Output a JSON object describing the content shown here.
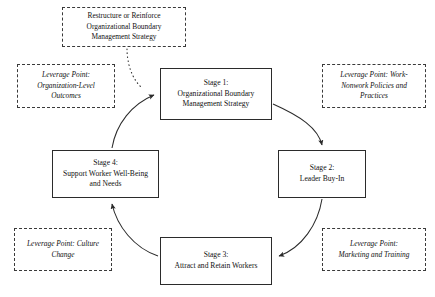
{
  "diagram": {
    "nodes": {
      "restructure": {
        "label": "Restructure or Reinforce\nOrganizational Boundary\nManagement Strategy",
        "style": "dashed"
      },
      "stage1": {
        "label": "Stage 1:\nOrganizational Boundary\nManagement Strategy",
        "style": "solid"
      },
      "stage2": {
        "label": "Stage 2:\nLeader Buy-In",
        "style": "solid"
      },
      "stage3": {
        "label": "Stage 3:\nAttract and Retain Workers",
        "style": "solid"
      },
      "stage4": {
        "label": "Stage 4:\nSupport Worker Well-Being\nand Needs",
        "style": "solid"
      }
    },
    "leverage_points": {
      "organization_outcomes": {
        "label": "Leverage Point:\nOrganization-Level\nOutcomes"
      },
      "work_nonwork_policies": {
        "label": "Leverage Point: Work-\nNonwork Policies and\nPractices"
      },
      "culture_change": {
        "label": "Leverage Point: Culture\nChange"
      },
      "marketing_training": {
        "label": "Leverage Point:\nMarketing and Training"
      }
    },
    "connectors": [
      {
        "name": "stage1-to-stage2",
        "from": "stage1",
        "to": "stage2",
        "style": "solid",
        "arrow": true
      },
      {
        "name": "stage2-to-stage3",
        "from": "stage2",
        "to": "stage3",
        "style": "solid",
        "arrow": true
      },
      {
        "name": "stage3-to-stage4",
        "from": "stage3",
        "to": "stage4",
        "style": "solid",
        "arrow": true
      },
      {
        "name": "stage4-to-stage1",
        "from": "stage4",
        "to": "stage1",
        "style": "solid",
        "arrow": true
      },
      {
        "name": "restructure-to-stage1",
        "from": "restructure",
        "to": "stage1",
        "style": "dotted",
        "arrow": true
      }
    ],
    "colors": {
      "stroke": "#2b2b2b",
      "dashed_stroke": "#3a3a3a",
      "background": "#ffffff",
      "text": "#111111"
    }
  }
}
